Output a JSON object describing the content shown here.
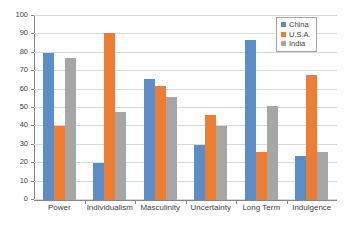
{
  "chart_data": {
    "type": "bar",
    "title": "",
    "subtitle": "",
    "xlabel": "",
    "ylabel": "",
    "ylim": [
      0,
      100
    ],
    "ytick_step": 10,
    "yticks": [
      0,
      10,
      20,
      30,
      40,
      50,
      60,
      70,
      80,
      90,
      100
    ],
    "grid": true,
    "legend_position": "top-right",
    "categories": [
      "Power",
      "Individualism",
      "Masculinity",
      "Uncertainty",
      "Long Term",
      "Indulgence"
    ],
    "series": [
      {
        "name": "China",
        "color": "#5b8dc8",
        "values": [
          80,
          20,
          66,
          30,
          87,
          24
        ]
      },
      {
        "name": "U.S.A.",
        "color": "#ed7d31",
        "values": [
          40,
          91,
          62,
          46,
          26,
          68
        ]
      },
      {
        "name": "India",
        "color": "#a6a6a6",
        "values": [
          77,
          48,
          56,
          40,
          51,
          26
        ]
      }
    ]
  },
  "legend": {
    "items": [
      {
        "label": "China",
        "swatch": "china"
      },
      {
        "label": "U.S.A.",
        "swatch": "usa"
      },
      {
        "label": "India",
        "swatch": "india"
      }
    ]
  },
  "colors": {
    "china": "#5b8dc8",
    "usa": "#ed7d31",
    "india": "#a6a6a6",
    "gridline": "#d9d9d9",
    "axis": "#868686",
    "text": "#3f3f3f",
    "background": "#ffffff"
  }
}
